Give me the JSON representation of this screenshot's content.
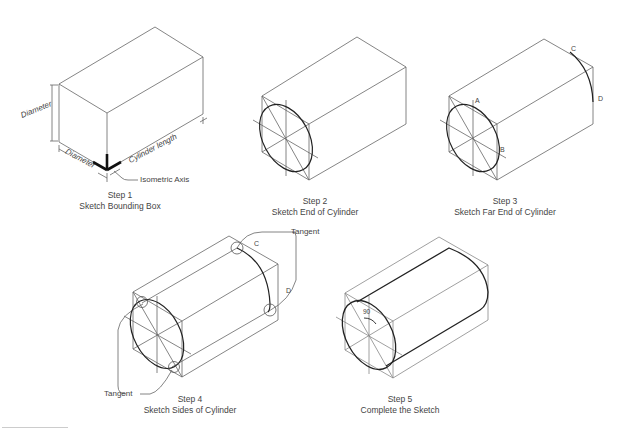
{
  "header": {
    "running_text": "",
    "page_number": ""
  },
  "steps": [
    {
      "number": "Step 1",
      "title": "Sketch Bounding Box",
      "labels": {
        "diameter_vertical": "Diameter",
        "diameter_bottom": "Diameter",
        "cylinder_length": "Cylinder length",
        "isometric_axis": "Isometric Axis"
      }
    },
    {
      "number": "Step 2",
      "title": "Sketch End of Cylinder"
    },
    {
      "number": "Step 3",
      "title": "Sketch Far End of Cylinder",
      "labels": {
        "a": "A",
        "b": "B",
        "c": "C",
        "d": "D"
      }
    },
    {
      "number": "Step 4",
      "title": "Sketch Sides of Cylinder",
      "labels": {
        "tangent_top": "Tangent",
        "tangent_bottom": "Tangent",
        "c": "C",
        "d": "D"
      }
    },
    {
      "number": "Step 5",
      "title": "Complete the Sketch",
      "labels": {
        "angle": "90"
      }
    }
  ],
  "colors": {
    "line": "#555555",
    "ellipse": "#222222",
    "axis": "#111111",
    "text": "#444444"
  }
}
